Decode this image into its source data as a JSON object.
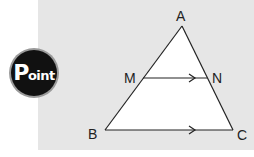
{
  "badge": {
    "label_initial": "P",
    "label_rest": "oint",
    "bg_color": "#111111",
    "ring_color": "#9a9a9a"
  },
  "panel": {
    "bg_color": "#e6e6e6"
  },
  "diagram": {
    "type": "triangle-midsegment",
    "vertices": {
      "A": {
        "label": "A",
        "x": 182,
        "y": 26
      },
      "B": {
        "label": "B",
        "x": 105,
        "y": 130
      },
      "C": {
        "label": "C",
        "x": 233,
        "y": 130
      }
    },
    "points": {
      "M": {
        "label": "M",
        "x": 143,
        "y": 78
      },
      "N": {
        "label": "N",
        "x": 207,
        "y": 78
      }
    },
    "parallel_segments": [
      "MN",
      "BC"
    ]
  }
}
